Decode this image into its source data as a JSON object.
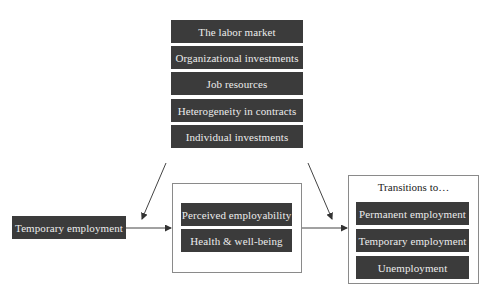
{
  "diagram": {
    "moderators": [
      {
        "label": "The labor market"
      },
      {
        "label": "Organizational investments"
      },
      {
        "label": "Job resources"
      },
      {
        "label": "Heterogeneity in contracts"
      },
      {
        "label": "Individual investments"
      }
    ],
    "source": {
      "label": "Temporary employment"
    },
    "mediators": [
      {
        "label": "Perceived employability"
      },
      {
        "label": "Health & well-being"
      }
    ],
    "outcomes": {
      "title": "Transitions to…",
      "items": [
        {
          "label": "Permanent employment"
        },
        {
          "label": "Temporary employment"
        },
        {
          "label": "Unemployment"
        }
      ]
    },
    "colors": {
      "box_fill": "#3b3b3b",
      "box_text": "#ececec",
      "frame_border": "#8a8a8a",
      "arrow": "#333333"
    }
  }
}
